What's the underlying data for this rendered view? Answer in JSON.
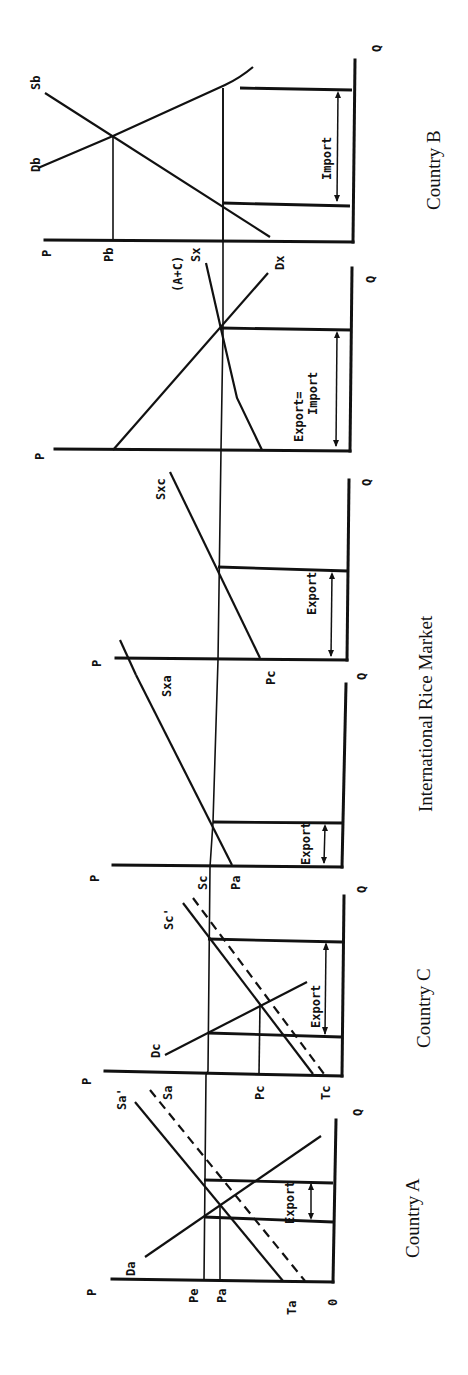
{
  "figure": {
    "rotation_deg": -90,
    "panels": [
      {
        "id": "country-a",
        "caption": "Country A",
        "labels": {
          "p_axis": "P",
          "q_axis": "Q",
          "origin": "0",
          "price_world": "Pe",
          "price_autarky": "Pa",
          "threshold": "Ta",
          "demand": "Da",
          "supply": "Sa",
          "supply_shifted": "Sa'",
          "flow": "Export"
        }
      },
      {
        "id": "country-c",
        "caption": "Country C",
        "labels": {
          "p_axis": "P",
          "q_axis": "Q",
          "price_autarky": "Pc",
          "threshold": "Tc",
          "demand": "Dc",
          "supply": "Sc",
          "supply_shifted": "Sc'",
          "flow": "Export"
        }
      },
      {
        "id": "export-supply-a",
        "labels": {
          "p_axis": "P",
          "q_axis": "Q",
          "price_autarky": "Pa",
          "supply": "Sxa",
          "flow": "Export"
        }
      },
      {
        "id": "export-supply-c",
        "labels": {
          "p_axis": "P",
          "q_axis": "Q",
          "price_autarky": "Pc",
          "supply": "Sxc",
          "flow": "Export"
        }
      },
      {
        "id": "international-market",
        "caption": "International Rice Market",
        "labels": {
          "p_axis": "P",
          "q_axis": "Q",
          "supply_top": "(A+C)",
          "supply": "Sx",
          "demand": "Dx",
          "flow_line1": "Export=",
          "flow_line2": "Import"
        }
      },
      {
        "id": "country-b",
        "caption": "Country B",
        "labels": {
          "p_axis": "P",
          "q_axis": "Q",
          "price_autarky": "Pb",
          "demand": "Db",
          "supply": "Sb",
          "flow": "Import"
        }
      }
    ],
    "group_caption": "International Rice Market"
  }
}
